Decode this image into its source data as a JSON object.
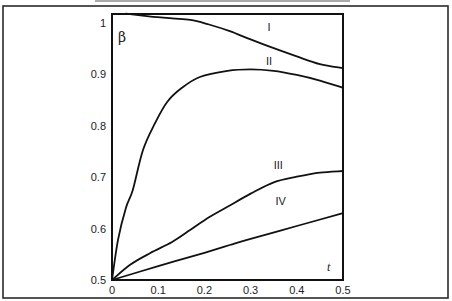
{
  "chart_data": {
    "type": "line",
    "title": "",
    "xlabel": "t",
    "ylabel": "β",
    "xlim": [
      0,
      0.5
    ],
    "ylim": [
      0.5,
      1.02
    ],
    "grid": false,
    "legend": "none (curves labeled inline)",
    "x_ticks": [
      "0",
      "0.1",
      "0.2",
      "0.3",
      "0.4",
      "0.5"
    ],
    "x_tick_values": [
      0,
      0.1,
      0.2,
      0.3,
      0.4,
      0.5
    ],
    "y_ticks": [
      "0.5",
      "0.6",
      "0.7",
      "0.8",
      "0.9",
      "1"
    ],
    "y_tick_values": [
      0.5,
      0.6,
      0.7,
      0.8,
      0.9,
      1.0
    ],
    "series": [
      {
        "name": "I",
        "label_at": [
          0.34,
          0.985
        ],
        "x": [
          0.03,
          0.08,
          0.13,
          0.17,
          0.21,
          0.255,
          0.3,
          0.35,
          0.4,
          0.45,
          0.5
        ],
        "y": [
          1.018,
          1.013,
          1.009,
          1.006,
          0.997,
          0.984,
          0.968,
          0.951,
          0.935,
          0.92,
          0.912
        ]
      },
      {
        "name": "II",
        "label_at": [
          0.34,
          0.918
        ],
        "x": [
          0,
          0.013,
          0.03,
          0.045,
          0.067,
          0.093,
          0.119,
          0.15,
          0.19,
          0.25,
          0.3,
          0.35,
          0.4,
          0.45,
          0.5
        ],
        "y": [
          0.5,
          0.578,
          0.64,
          0.675,
          0.753,
          0.805,
          0.846,
          0.873,
          0.895,
          0.907,
          0.91,
          0.907,
          0.899,
          0.888,
          0.874
        ]
      },
      {
        "name": "III",
        "label_at": [
          0.36,
          0.715
        ],
        "x": [
          0,
          0.04,
          0.082,
          0.13,
          0.169,
          0.21,
          0.255,
          0.3,
          0.35,
          0.4,
          0.45,
          0.5
        ],
        "y": [
          0.5,
          0.53,
          0.552,
          0.574,
          0.597,
          0.622,
          0.645,
          0.668,
          0.69,
          0.701,
          0.709,
          0.712
        ]
      },
      {
        "name": "IV",
        "label_at": [
          0.365,
          0.645
        ],
        "x": [
          0,
          0.1,
          0.2,
          0.255,
          0.3,
          0.4,
          0.5
        ],
        "y": [
          0.5,
          0.527,
          0.553,
          0.568,
          0.58,
          0.605,
          0.63
        ]
      }
    ]
  }
}
